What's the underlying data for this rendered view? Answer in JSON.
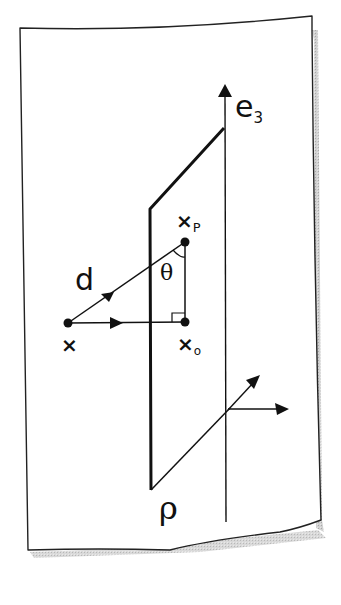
{
  "diagram": {
    "type": "hand-drawn geometry sketch",
    "labels": {
      "e3_base": "e",
      "e3_sub": "3",
      "direction": "d",
      "angle": "θ",
      "point": "×",
      "foot_base": "×",
      "foot_sub": "o",
      "proj_base": "×",
      "proj_sub": "P",
      "plane": "ρ"
    },
    "colors": {
      "ink": "#111111",
      "paper": "#ffffff",
      "shadow": "#b5b5b5"
    },
    "elements": [
      {
        "id": "paper-sheet",
        "kind": "outline"
      },
      {
        "id": "e3-axis",
        "kind": "vector",
        "label": "e3"
      },
      {
        "id": "plane-P",
        "kind": "parallelogram",
        "label": "ρ"
      },
      {
        "id": "point-x",
        "kind": "point",
        "label": "x"
      },
      {
        "id": "point-xo",
        "kind": "point",
        "label": "x_o"
      },
      {
        "id": "point-xp",
        "kind": "point",
        "label": "x_P"
      },
      {
        "id": "vector-d",
        "kind": "vector",
        "from": "x",
        "to": "x_P",
        "label": "d"
      },
      {
        "id": "perpendicular-vector",
        "kind": "vector",
        "from": "x",
        "to": "x_o"
      },
      {
        "id": "segment-xo-xp",
        "kind": "segment",
        "from": "x_o",
        "to": "x_P"
      },
      {
        "id": "right-angle-marker",
        "kind": "marker",
        "at": "x_o"
      },
      {
        "id": "angle-arc",
        "kind": "arc",
        "at": "x_P",
        "label": "θ"
      },
      {
        "id": "basis-e1",
        "kind": "vector"
      },
      {
        "id": "basis-e2",
        "kind": "vector"
      }
    ]
  }
}
